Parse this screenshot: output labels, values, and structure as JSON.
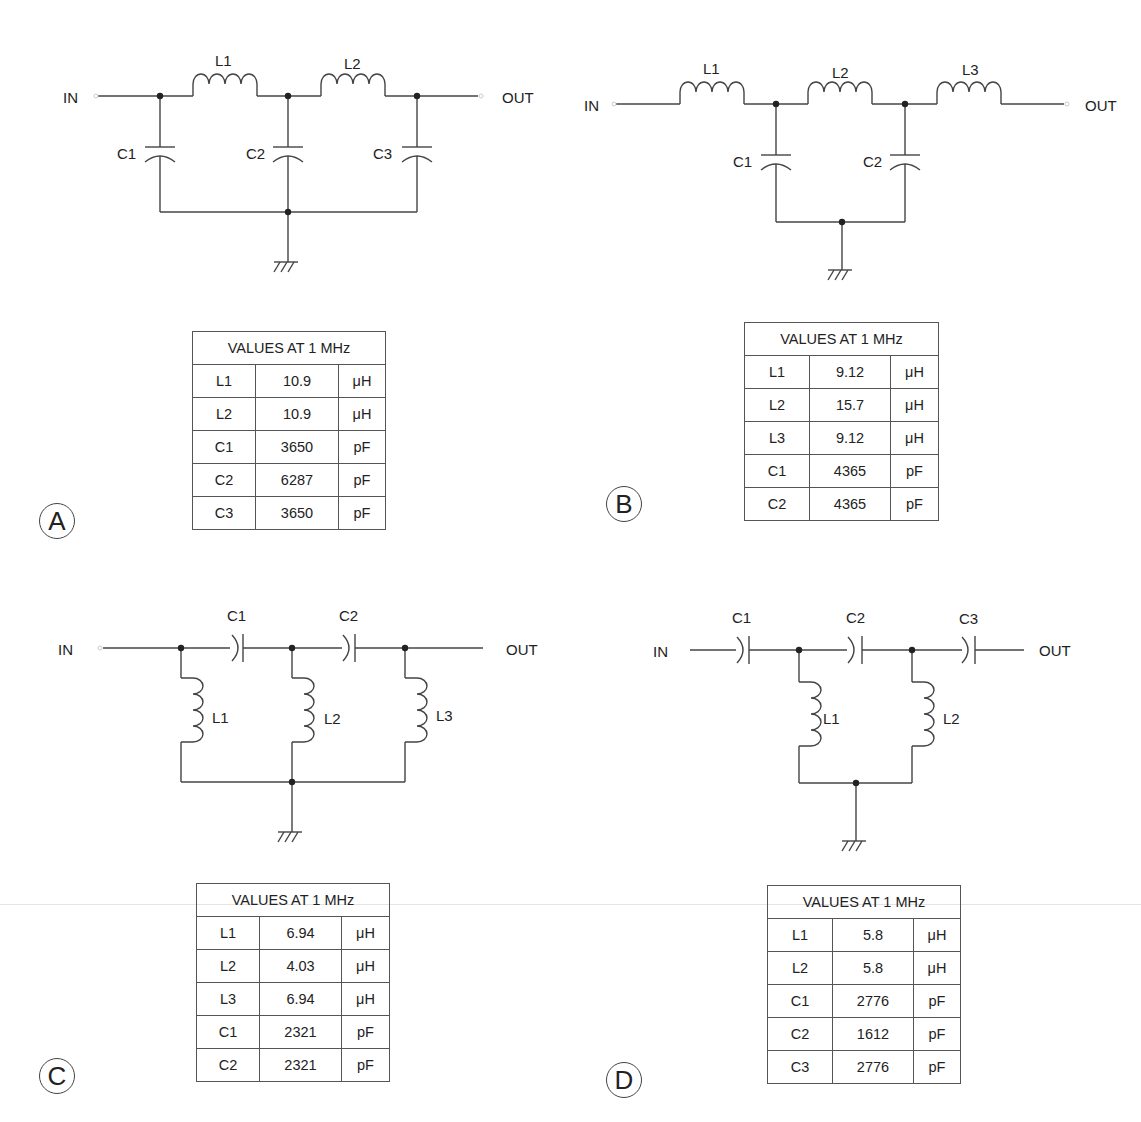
{
  "common": {
    "in_label": "IN",
    "out_label": "OUT",
    "table_title": "VALUES AT 1 MHz"
  },
  "panels": {
    "A": {
      "letter": "A",
      "topology": "low-pass pi (shunt C, series L)",
      "labels": {
        "L1": "L1",
        "L2": "L2",
        "C1": "C1",
        "C2": "C2",
        "C3": "C3"
      },
      "rows": [
        {
          "name": "L1",
          "value": "10.9",
          "unit": "μH"
        },
        {
          "name": "L2",
          "value": "10.9",
          "unit": "μH"
        },
        {
          "name": "C1",
          "value": "3650",
          "unit": "pF"
        },
        {
          "name": "C2",
          "value": "6287",
          "unit": "pF"
        },
        {
          "name": "C3",
          "value": "3650",
          "unit": "pF"
        }
      ]
    },
    "B": {
      "letter": "B",
      "topology": "low-pass T (series L, shunt C)",
      "labels": {
        "L1": "L1",
        "L2": "L2",
        "L3": "L3",
        "C1": "C1",
        "C2": "C2"
      },
      "rows": [
        {
          "name": "L1",
          "value": "9.12",
          "unit": "μH"
        },
        {
          "name": "L2",
          "value": "15.7",
          "unit": "μH"
        },
        {
          "name": "L3",
          "value": "9.12",
          "unit": "μH"
        },
        {
          "name": "C1",
          "value": "4365",
          "unit": "pF"
        },
        {
          "name": "C2",
          "value": "4365",
          "unit": "pF"
        }
      ]
    },
    "C": {
      "letter": "C",
      "topology": "high-pass pi (series C, shunt L)",
      "labels": {
        "C1": "C1",
        "C2": "C2",
        "L1": "L1",
        "L2": "L2",
        "L3": "L3"
      },
      "rows": [
        {
          "name": "L1",
          "value": "6.94",
          "unit": "μH"
        },
        {
          "name": "L2",
          "value": "4.03",
          "unit": "μH"
        },
        {
          "name": "L3",
          "value": "6.94",
          "unit": "μH"
        },
        {
          "name": "C1",
          "value": "2321",
          "unit": "pF"
        },
        {
          "name": "C2",
          "value": "2321",
          "unit": "pF"
        }
      ]
    },
    "D": {
      "letter": "D",
      "topology": "high-pass T (series C, shunt L)",
      "labels": {
        "C1": "C1",
        "C2": "C2",
        "C3": "C3",
        "L1": "L1",
        "L2": "L2"
      },
      "rows": [
        {
          "name": "L1",
          "value": "5.8",
          "unit": "μH"
        },
        {
          "name": "L2",
          "value": "5.8",
          "unit": "μH"
        },
        {
          "name": "C1",
          "value": "2776",
          "unit": "pF"
        },
        {
          "name": "C2",
          "value": "1612",
          "unit": "pF"
        },
        {
          "name": "C3",
          "value": "2776",
          "unit": "pF"
        }
      ]
    }
  }
}
